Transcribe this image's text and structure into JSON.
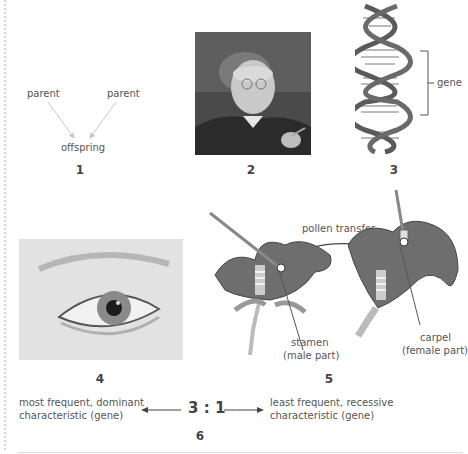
{
  "figure": {
    "panels": [
      {
        "number": "1",
        "type": "inheritance-diagram",
        "labels": {
          "parent_left": "parent",
          "parent_right": "parent",
          "child": "offspring"
        }
      },
      {
        "number": "2",
        "type": "portrait-photo"
      },
      {
        "number": "3",
        "type": "dna-helix",
        "labels": {
          "bracket": "gene"
        }
      },
      {
        "number": "4",
        "type": "eye-photo"
      },
      {
        "number": "5",
        "type": "pollination-diagram",
        "labels": {
          "transfer": "pollen transfer",
          "stamen": "stamen",
          "stamen_note": "(male part)",
          "carpel": "carpel",
          "carpel_note": "(female part)"
        }
      },
      {
        "number": "6",
        "type": "ratio",
        "ratio": "3 : 1",
        "left_line1": "most frequent, dominant",
        "left_line2": "characteristic (gene)",
        "right_line1": "least frequent, recessive",
        "right_line2": "characteristic (gene)"
      }
    ],
    "colors": {
      "text": "#555555",
      "number": "#444444",
      "arrow_light": "#c8c8c8",
      "flower": "#6e6e6e",
      "helix": "#5a5a5a"
    }
  }
}
